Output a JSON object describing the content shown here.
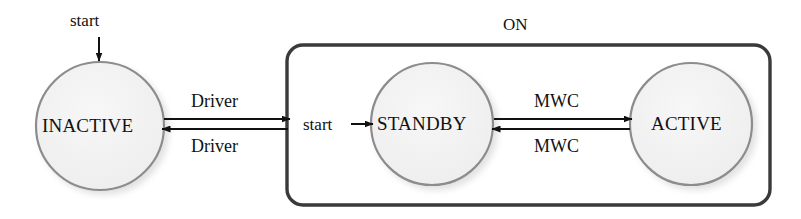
{
  "diagram": {
    "type": "state-machine-diagram",
    "canvas": {
      "width": 801,
      "height": 219,
      "background": "#ffffff"
    },
    "colors": {
      "state_fill": "#f1f1f1",
      "state_stroke": "#8c8c8c",
      "group_stroke": "#3a3a3a",
      "arrow": "#111111",
      "text": "#111111",
      "shadow": "#c9c9c9"
    },
    "states": [
      {
        "id": "inactive",
        "label": "INACTIVE",
        "cx": 100,
        "cy": 126,
        "r": 64
      },
      {
        "id": "standby",
        "label": "STANDBY",
        "cx": 432,
        "cy": 124,
        "r": 61
      },
      {
        "id": "active",
        "label": "ACTIVE",
        "cx": 691,
        "cy": 124,
        "r": 61
      }
    ],
    "groups": [
      {
        "id": "on-group",
        "label": "ON",
        "x": 287,
        "y": 45,
        "width": 483,
        "height": 160,
        "radius": 16
      }
    ],
    "entry_points": [
      {
        "id": "entry-inactive",
        "label": "start",
        "target": "inactive",
        "direction": "down"
      },
      {
        "id": "entry-standby",
        "label": "start",
        "target": "standby",
        "direction": "right"
      }
    ],
    "transitions": [
      {
        "id": "inactive-to-on",
        "label": "Driver",
        "from": "INACTIVE",
        "to": "ON",
        "direction": "right"
      },
      {
        "id": "on-to-inactive",
        "label": "Driver",
        "from": "ON",
        "to": "INACTIVE",
        "direction": "left"
      },
      {
        "id": "standby-to-active",
        "label": "MWC",
        "from": "STANDBY",
        "to": "ACTIVE",
        "direction": "right"
      },
      {
        "id": "active-to-standby",
        "label": "MWC",
        "from": "ACTIVE",
        "to": "STANDBY",
        "direction": "left"
      }
    ]
  }
}
